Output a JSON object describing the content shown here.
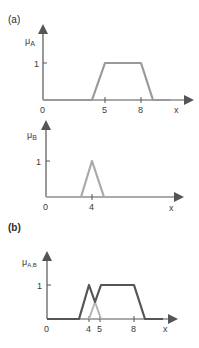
{
  "panels": {
    "a": {
      "label": "(a)"
    },
    "b": {
      "label": "(b)"
    }
  },
  "plots": [
    {
      "id": "mu_A",
      "ylabel_base": "μ",
      "ylabel_sub": "A",
      "one_label": "1",
      "origin_label": "0",
      "xlabel": "x",
      "ticks": [
        "5",
        "8"
      ],
      "color": "#999999"
    },
    {
      "id": "mu_B",
      "ylabel_base": "μ",
      "ylabel_sub": "B",
      "one_label": "1",
      "origin_label": "0",
      "xlabel": "x",
      "ticks": [
        "4"
      ],
      "color": "#aaaaaa"
    },
    {
      "id": "mu_A_B",
      "ylabel_base": "μ",
      "ylabel_sub": "A,B",
      "one_label": "1",
      "origin_label": "0",
      "xlabel": "x",
      "ticks": [
        "4",
        "5",
        "8"
      ],
      "dark_color": "#555555",
      "light_color": "#b5b5b5"
    }
  ],
  "colors": {
    "axis": "#555555",
    "text": "#3a3a3a"
  }
}
